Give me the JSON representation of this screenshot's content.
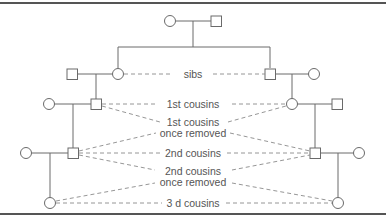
{
  "diagram": {
    "type": "pedigree-chart",
    "legend": {
      "circle": "female",
      "square": "male",
      "solid_line": "descent / marriage",
      "dashed_line": "relationship"
    },
    "labels": {
      "sibs": "sibs",
      "first_cousins": "1st cousins",
      "first_cousins_once_removed_line1": "1st cousins",
      "first_cousins_once_removed_line2": "once removed",
      "second_cousins": "2nd cousins",
      "second_cousins_once_removed_line1": "2nd cousins",
      "second_cousins_once_removed_line2": "once removed",
      "third_cousins": "3 d cousins"
    },
    "generations": [
      {
        "level": 1,
        "members": [
          "female",
          "male"
        ]
      },
      {
        "level": 2,
        "left": [
          "male",
          "female"
        ],
        "right": [
          "male",
          "female"
        ]
      },
      {
        "level": 3,
        "left": [
          "female",
          "male"
        ],
        "right": [
          "female",
          "male"
        ]
      },
      {
        "level": 4,
        "left": [
          "female",
          "male"
        ],
        "right": [
          "male",
          "female"
        ]
      },
      {
        "level": 5,
        "left": [
          "female"
        ],
        "right": [
          "female"
        ]
      }
    ],
    "colors": {
      "frame": "#555555",
      "lines": "#6a6a6a",
      "dashes": "#8a8a8a",
      "text": "#555555",
      "background": "#ffffff"
    }
  }
}
